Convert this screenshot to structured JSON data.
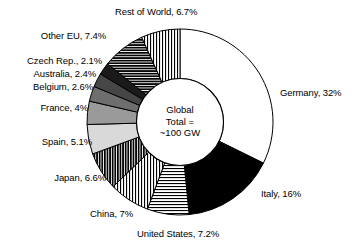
{
  "chart_data": {
    "type": "pie",
    "title": "",
    "subtitle": "",
    "xlabel": "",
    "ylabel": "",
    "legend_position": "none",
    "grid": false,
    "donut": true,
    "units": "%",
    "start_angle_deg": 0,
    "direction": "clockwise",
    "center_annotation": [
      "Global",
      "Total =",
      "~100 GW"
    ],
    "categories": [
      "Germany",
      "Italy",
      "United States",
      "China",
      "Japan",
      "Spain",
      "France",
      "Belgium",
      "Australia",
      "Czech Rep.",
      "Other EU",
      "Rest of World"
    ],
    "values": [
      32,
      16,
      7.2,
      7,
      6.6,
      5.1,
      4,
      2.6,
      2.4,
      2.1,
      7.4,
      6.7
    ],
    "slices": [
      {
        "name": "Germany",
        "value": 32,
        "label": "Germany, 32%",
        "fill": "white",
        "color": "#ffffff",
        "pattern": "solid"
      },
      {
        "name": "Italy",
        "value": 16,
        "label": "Italy, 16%",
        "fill": "black",
        "color": "#000000",
        "pattern": "solid"
      },
      {
        "name": "United States",
        "value": 7.2,
        "label": "United States, 7.2%",
        "fill": "horizontal-lines",
        "color": "#000000",
        "pattern": "horizontal"
      },
      {
        "name": "China",
        "value": 7,
        "label": "China, 7%",
        "fill": "vertical-lines",
        "color": "#000000",
        "pattern": "vertical"
      },
      {
        "name": "Japan",
        "value": 6.6,
        "label": "Japan, 6.6%",
        "fill": "dense-vertical-lines",
        "color": "#000000",
        "pattern": "vertical-dense"
      },
      {
        "name": "Spain",
        "value": 5.1,
        "label": "Spain, 5.1%",
        "fill": "light-gray",
        "color": "#d9d9d9",
        "pattern": "solid"
      },
      {
        "name": "France",
        "value": 4,
        "label": "France, 4%",
        "fill": "gray",
        "color": "#9a9a9a",
        "pattern": "solid"
      },
      {
        "name": "Belgium",
        "value": 2.6,
        "label": "Belgium, 2.6%",
        "fill": "medium-gray",
        "color": "#6e6e6e",
        "pattern": "solid"
      },
      {
        "name": "Australia",
        "value": 2.4,
        "label": "Australia, 2.4%",
        "fill": "dark-gray",
        "color": "#464646",
        "pattern": "solid"
      },
      {
        "name": "Czech Rep.",
        "value": 2.1,
        "label": "Czech Rep., 2.1%",
        "fill": "near-black",
        "color": "#1a1a1a",
        "pattern": "solid"
      },
      {
        "name": "Other EU",
        "value": 7.4,
        "label": "Other EU, 7.4%",
        "fill": "dense-horizontal-lines",
        "color": "#000000",
        "pattern": "horizontal-dense"
      },
      {
        "name": "Rest of World",
        "value": 6.7,
        "label": "Rest of World, 6.7%",
        "fill": "vertical-lines",
        "color": "#000000",
        "pattern": "vertical"
      }
    ]
  },
  "center": {
    "line1": "Global",
    "line2": "Total =",
    "line3": "~100 GW"
  },
  "labels": {
    "rest_of_world": "Rest of World, 6.7%",
    "other_eu": "Other EU, 7.4%",
    "czech": "Czech Rep., 2.1%",
    "australia": "Australia, 2.4%",
    "belgium": "Belgium, 2.6%",
    "france": "France, 4%",
    "spain": "Spain, 5.1%",
    "japan": "Japan, 6.6%",
    "china": "China, 7%",
    "united_states": "United States, 7.2%",
    "italy": "Italy, 16%",
    "germany": "Germany, 32%"
  }
}
